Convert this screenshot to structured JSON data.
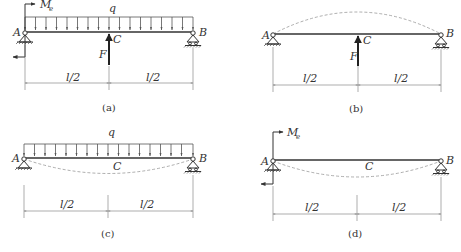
{
  "figure": {
    "panels": [
      {
        "id": "a",
        "caption": "(a)",
        "labels": {
          "A": "A",
          "B": "B",
          "C": "C",
          "q": "q",
          "F": "F",
          "Me": "M",
          "Me_sub": "e",
          "dim_left": "l/2",
          "dim_right": "l/2"
        }
      },
      {
        "id": "b",
        "caption": "(b)",
        "labels": {
          "A": "A",
          "B": "B",
          "C": "C",
          "F": "F",
          "dim_left": "l/2",
          "dim_right": "l/2"
        }
      },
      {
        "id": "c",
        "caption": "(c)",
        "labels": {
          "A": "A",
          "B": "B",
          "C": "C",
          "q": "q",
          "dim_left": "l/2",
          "dim_right": "l/2"
        }
      },
      {
        "id": "d",
        "caption": "(d)",
        "labels": {
          "A": "A",
          "B": "B",
          "C": "C",
          "Me": "M",
          "Me_sub": "e",
          "dim_left": "l/2",
          "dim_right": "l/2"
        }
      }
    ]
  },
  "colors": {
    "line": "#333333",
    "dashed": "#999999",
    "dim": "#777777"
  }
}
